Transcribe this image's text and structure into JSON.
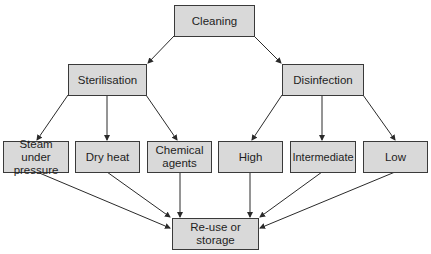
{
  "diagram": {
    "type": "flowchart-tree",
    "colors": {
      "node_fill": "#d9d9d9",
      "node_border": "#3a3a3a",
      "edge": "#2a2a2a",
      "text": "#1e1e1e"
    },
    "nodes": {
      "cleaning": {
        "label": "Cleaning"
      },
      "sterilisation": {
        "label": "Sterilisation"
      },
      "disinfection": {
        "label": "Disinfection"
      },
      "steam": {
        "label": "Steam under pressure"
      },
      "dry_heat": {
        "label": "Dry heat"
      },
      "chemical": {
        "label": "Chemical agents"
      },
      "high": {
        "label": "High"
      },
      "intermediate": {
        "label": "Intermediate"
      },
      "low": {
        "label": "Low"
      },
      "reuse": {
        "label": "Re-use or storage"
      }
    },
    "edges": [
      [
        "cleaning",
        "sterilisation"
      ],
      [
        "cleaning",
        "disinfection"
      ],
      [
        "sterilisation",
        "steam"
      ],
      [
        "sterilisation",
        "dry_heat"
      ],
      [
        "sterilisation",
        "chemical"
      ],
      [
        "disinfection",
        "high"
      ],
      [
        "disinfection",
        "intermediate"
      ],
      [
        "disinfection",
        "low"
      ],
      [
        "steam",
        "reuse"
      ],
      [
        "dry_heat",
        "reuse"
      ],
      [
        "chemical",
        "reuse"
      ],
      [
        "high",
        "reuse"
      ],
      [
        "intermediate",
        "reuse"
      ],
      [
        "low",
        "reuse"
      ]
    ]
  }
}
